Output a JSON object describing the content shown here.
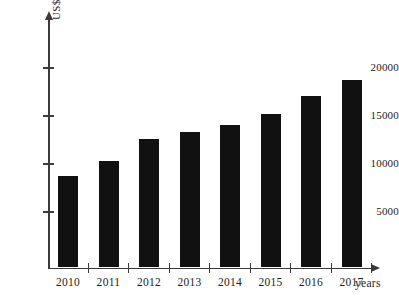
{
  "chart_data": {
    "type": "bar",
    "title": "",
    "subtitle": "",
    "xlabel": "years",
    "ylabel": "US$M",
    "categories": [
      "2010",
      "2011",
      "2012",
      "2013",
      "2014",
      "2015",
      "2016",
      "2017"
    ],
    "values": [
      8700,
      10300,
      12600,
      13300,
      14100,
      15200,
      17100,
      18700
    ],
    "series": [
      {
        "name": "US$M",
        "values": [
          8700,
          10300,
          12600,
          13300,
          14100,
          15200,
          17100,
          18700
        ]
      }
    ],
    "ylim": [
      0,
      21500
    ],
    "y_ticks": [
      5000,
      10000,
      15000,
      20000
    ],
    "y_tick_labels": [
      "5000",
      "10000",
      "15000",
      "20000"
    ],
    "grid": false,
    "legend": false,
    "legend_position": "none",
    "bar_color": "#111111",
    "axis_color": "#3a3a3a",
    "background_color": "#ffffff",
    "annotations": []
  },
  "axes": {
    "y_axis_title": "US$M",
    "x_axis_title": "years"
  }
}
